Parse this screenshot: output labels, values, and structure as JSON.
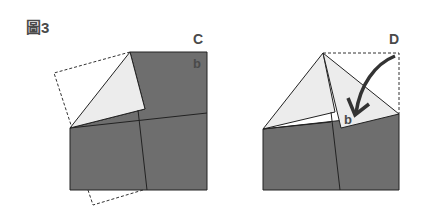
{
  "figure": {
    "title": "圖3",
    "panels": [
      {
        "id": "C",
        "label": "C",
        "flap_label": "b"
      },
      {
        "id": "D",
        "label": "D",
        "flap_label": "b"
      }
    ]
  },
  "colors": {
    "paper_gray": "#6e6e6e",
    "flap_light": "#ececec",
    "line": "#222222",
    "text": "#4a4a4a"
  }
}
